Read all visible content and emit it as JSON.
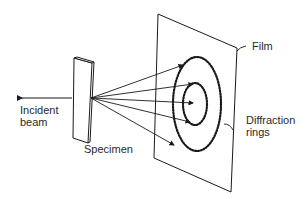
{
  "diagram": {
    "labels": {
      "film": "Film",
      "incident_beam": "Incident\nbeam",
      "specimen": "Specimen",
      "diffraction_rings": "Diffraction\nrings"
    },
    "components": [
      {
        "id": "incident-beam",
        "type": "arrow"
      },
      {
        "id": "specimen",
        "type": "thin plate"
      },
      {
        "id": "diffracted-rays",
        "type": "arrows",
        "count": 5
      },
      {
        "id": "film",
        "type": "plane"
      },
      {
        "id": "diffraction-rings",
        "type": "dotted ellipses",
        "count": 2
      }
    ],
    "line_color": "#1a1a1a"
  }
}
